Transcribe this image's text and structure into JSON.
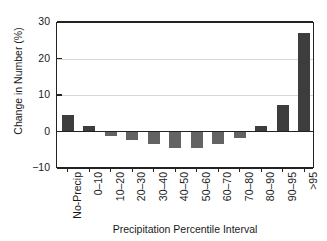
{
  "chart_data": {
    "type": "bar",
    "title": "",
    "xlabel": "Precipitation Percentile Interval",
    "ylabel": "Change in Number (%)",
    "categories": [
      "No-Precip",
      "0–10",
      "10–20",
      "20–30",
      "30–40",
      "40–50",
      "50–60",
      "60–70",
      "70–80",
      "80–90",
      "90–95",
      ">95"
    ],
    "values": [
      4.5,
      1.5,
      -1.2,
      -2.2,
      -3.3,
      -4.5,
      -4.5,
      -3.5,
      -1.8,
      1.5,
      7.3,
      27.0
    ],
    "ylim": [
      -10,
      30
    ],
    "yticks": [
      30,
      20,
      10,
      0,
      -10
    ],
    "ytick_labels": [
      "30",
      "20",
      "10",
      "0",
      "−10"
    ],
    "grid": true,
    "legend": "none",
    "colors": {
      "positive_bar": "#3d3d3d",
      "negative_bar": "#636363",
      "axis": "#222222",
      "gridline": "#d8d8d8",
      "background": "#ffffff"
    }
  }
}
